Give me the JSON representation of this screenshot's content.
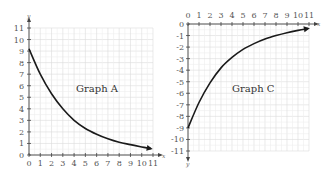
{
  "chart_data": [
    {
      "type": "line",
      "title": "Graph A",
      "xlabel": "x",
      "ylabel": "y",
      "xlim": [
        0,
        11
      ],
      "ylim": [
        0,
        11
      ],
      "grid": true,
      "x_ticks": [
        "0",
        "1",
        "2",
        "3",
        "4",
        "5",
        "6",
        "7",
        "8",
        "9",
        "10",
        "11"
      ],
      "y_ticks": [
        "0",
        "1",
        "2",
        "3",
        "4",
        "5",
        "6",
        "7",
        "8",
        "9",
        "10",
        "11"
      ],
      "series": [
        {
          "name": "Graph A curve",
          "description": "decreasing exponential decay starting at (0, 9.2), arrow toward x≈10.8",
          "x": [
            0,
            1,
            2,
            3,
            4,
            5,
            6,
            7,
            8,
            9,
            10,
            10.8
          ],
          "y": [
            9.2,
            7.0,
            5.3,
            4.0,
            3.0,
            2.3,
            1.8,
            1.4,
            1.1,
            0.9,
            0.7,
            0.55
          ]
        }
      ]
    },
    {
      "type": "line",
      "title": "Graph C",
      "xlabel": "x",
      "ylabel": "y",
      "xlim": [
        0,
        11
      ],
      "ylim": [
        -11,
        0
      ],
      "grid": true,
      "x_ticks": [
        "0",
        "1",
        "2",
        "3",
        "4",
        "5",
        "6",
        "7",
        "8",
        "9",
        "10",
        "11"
      ],
      "y_ticks": [
        "0",
        "-1",
        "-2",
        "-3",
        "-4",
        "-5",
        "-6",
        "-7",
        "-8",
        "-9",
        "-10",
        "-11"
      ],
      "series": [
        {
          "name": "Graph C curve",
          "description": "increasing curve starting at (0, -9), approaching 0, arrow toward x≈10.9",
          "x": [
            0,
            1,
            2,
            3,
            4,
            5,
            6,
            7,
            8,
            9,
            10,
            10.9
          ],
          "y": [
            -9.0,
            -6.8,
            -5.1,
            -3.8,
            -2.9,
            -2.2,
            -1.7,
            -1.3,
            -1.0,
            -0.75,
            -0.55,
            -0.4
          ]
        }
      ]
    }
  ],
  "graphA": {
    "title": "Graph A",
    "x_axis_label": "x",
    "y_axis_label": "y"
  },
  "graphC": {
    "title": "Graph C",
    "x_axis_label": "x",
    "y_axis_label": "y"
  }
}
